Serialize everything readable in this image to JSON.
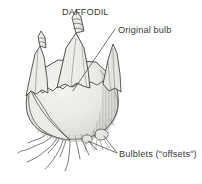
{
  "figure": {
    "title": "DAFFODIL",
    "labels": {
      "original_bulb": "Original bulb",
      "bulblets": "Bulblets (\"offsets\")"
    },
    "colors": {
      "background": "#ffffff",
      "ink": "#3a3a3a",
      "outline": "#2e2e2e",
      "leader_line": "#4a4a4a",
      "scale_fill_light": "#f2f2f0",
      "scale_fill_mid": "#e6e6e3",
      "scale_fill_shadow": "#d8d8d4",
      "hatch": "#9a9a96"
    }
  }
}
